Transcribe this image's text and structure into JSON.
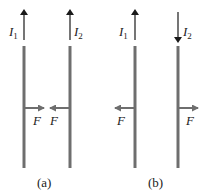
{
  "colors": {
    "wire": "#6e6e6e",
    "force_arrow": "#6e6e6e",
    "current_arrow": "#1a1a1a",
    "text": "#222222"
  },
  "panels": [
    {
      "caption": "(a)",
      "wires": [
        {
          "current_label": "I",
          "current_sub": "1",
          "current_direction": "up",
          "force_label": "F",
          "force_direction": "right"
        },
        {
          "current_label": "I",
          "current_sub": "2",
          "current_direction": "up",
          "force_label": "F",
          "force_direction": "left"
        }
      ]
    },
    {
      "caption": "(b)",
      "wires": [
        {
          "current_label": "I",
          "current_sub": "1",
          "current_direction": "up",
          "force_label": "F",
          "force_direction": "left"
        },
        {
          "current_label": "I",
          "current_sub": "2",
          "current_direction": "down",
          "force_label": "F",
          "force_direction": "right"
        }
      ]
    }
  ]
}
